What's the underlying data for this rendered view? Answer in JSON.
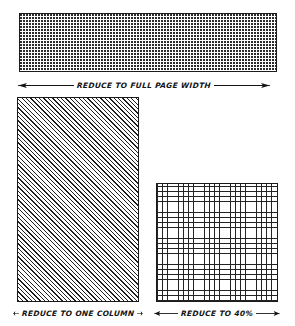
{
  "page": {
    "background_color": "#ffffff",
    "ink_color": "#141414"
  },
  "figures": [
    {
      "id": "full-page-width",
      "texture": "dense-dot-halftone",
      "caption": "REDUCE TO FULL PAGE WIDTH",
      "arrow": "double-headed-horizontal"
    },
    {
      "id": "one-column",
      "texture": "diagonal-hatch-45",
      "caption": "REDUCE TO ONE COLUMN",
      "arrow": "double-headed-horizontal"
    },
    {
      "id": "forty-percent",
      "texture": "fine-cross-hatch-grid",
      "caption": "REDUCE TO 40%",
      "arrow": "double-headed-horizontal"
    }
  ]
}
